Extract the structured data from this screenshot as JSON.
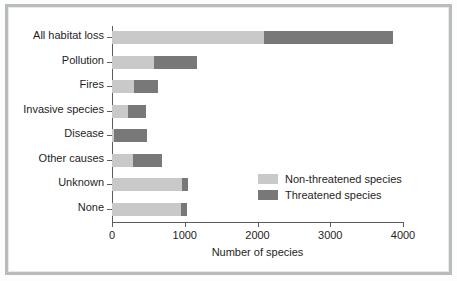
{
  "chart_data": {
    "type": "bar",
    "orientation": "horizontal",
    "stacked": true,
    "title": "",
    "xlabel": "Number of species",
    "ylabel": "",
    "xlim": [
      0,
      4000
    ],
    "xticks": [
      0,
      1000,
      2000,
      3000,
      4000
    ],
    "xtick_labels": [
      "0",
      "1000",
      "2000",
      "3000",
      "4000"
    ],
    "grid": false,
    "legend_position": "inside-right",
    "categories": [
      "All habitat loss",
      "Pollution",
      "Fires",
      "Invasive species",
      "Disease",
      "Other causes",
      "Unknown",
      "None"
    ],
    "series": [
      {
        "name": "Non-threatened species",
        "color": "#c9c9c9",
        "values": [
          2090,
          575,
          300,
          220,
          30,
          290,
          960,
          950
        ]
      },
      {
        "name": "Threatened species",
        "color": "#787878",
        "values": [
          1770,
          590,
          330,
          245,
          450,
          400,
          80,
          80
        ]
      }
    ],
    "totals": [
      3860,
      1165,
      630,
      465,
      480,
      690,
      1040,
      1030
    ]
  },
  "legend": {
    "entries": [
      {
        "label": "Non-threatened species",
        "color": "#c9c9c9"
      },
      {
        "label": "Threatened species",
        "color": "#787878"
      }
    ]
  },
  "axis": {
    "x_title": "Number of species"
  }
}
